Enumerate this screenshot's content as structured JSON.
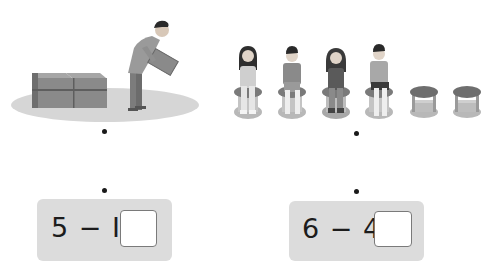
{
  "exercises": [
    {
      "id": "left",
      "scene": "man-moving-boxes",
      "scene_description": "A man carries one box away from a stack; boxes remain",
      "equation": {
        "text": "5 − I =",
        "a": "5",
        "operator": "−",
        "b": "I",
        "equals": "=",
        "answer": ""
      }
    },
    {
      "id": "right",
      "scene": "children-on-stools",
      "scene_description": "Four children sit on stools; two stools are empty",
      "children_count": 4,
      "empty_stools_count": 2,
      "equation": {
        "text": "6 − 4 =",
        "a": "6",
        "operator": "−",
        "b": "4",
        "equals": "=",
        "answer": ""
      }
    }
  ],
  "colors": {
    "panel_bg": "#dcdcdc",
    "answer_bg": "#ffffff",
    "answer_border": "#7a7a7a",
    "ground": "#d6d6d6",
    "box": "#8a8a8a"
  }
}
